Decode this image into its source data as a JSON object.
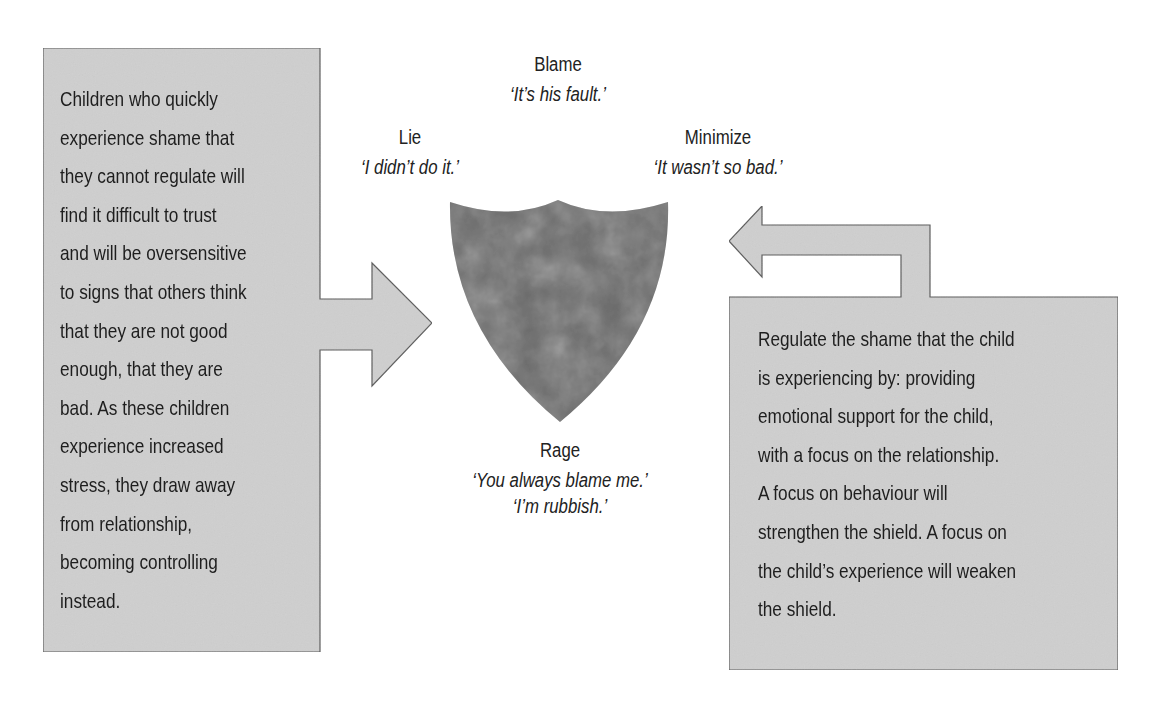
{
  "diagram": {
    "shield": {
      "name": "shield",
      "fill": "#6b6b6b"
    },
    "labels": [
      {
        "id": "blame",
        "title": "Blame",
        "quotes": [
          "‘It’s his fault.’"
        ]
      },
      {
        "id": "lie",
        "title": "Lie",
        "quotes": [
          "‘I didn’t do it.’"
        ]
      },
      {
        "id": "minimize",
        "title": "Minimize",
        "quotes": [
          "‘It wasn’t so bad.’"
        ]
      },
      {
        "id": "rage",
        "title": "Rage",
        "quotes": [
          "‘You always blame me.’",
          "‘I’m rubbish.’"
        ]
      }
    ],
    "left_box": {
      "lines": [
        "Children who quickly",
        "experience shame that",
        "they cannot regulate will",
        "find it difficult to trust",
        "and will be oversensitive",
        "to signs that others think",
        "that they are not good",
        "enough, that they are",
        "bad. As these children",
        "experience increased",
        "stress, they draw away",
        "from relationship,",
        "becoming controlling",
        "instead."
      ]
    },
    "right_box": {
      "lines": [
        "Regulate the shame that the child",
        "is experiencing by: providing",
        "emotional support for the child,",
        "with a focus on the relationship.",
        "A focus on behaviour will",
        "strengthen the shield. A focus on",
        "the child’s experience will weaken",
        "the shield."
      ]
    },
    "colors": {
      "box_fill": "#cfcfcf",
      "box_border": "#5a5a5a",
      "shield": "#6b6b6b"
    }
  }
}
